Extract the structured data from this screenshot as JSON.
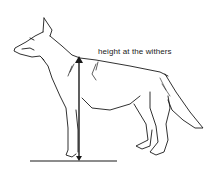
{
  "diagram": {
    "annotation": {
      "label": "height at the withers",
      "measure": "vertical-arrow-from-ground-to-withers"
    },
    "colors": {
      "ink": "#1a1a1a",
      "background": "#ffffff"
    }
  }
}
